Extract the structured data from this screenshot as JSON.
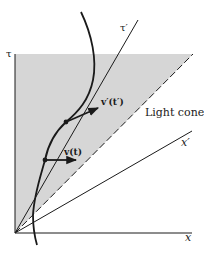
{
  "diagram": {
    "labels": {
      "tau_axis": "τ",
      "tau_prime_axis": "τ′",
      "x_axis": "x",
      "x_prime_axis": "x′",
      "light_cone": "Light cone",
      "velocity": "v(t)",
      "velocity_prime": "v′(t′)"
    },
    "colors": {
      "shade": "#d6d6d6",
      "line": "#1a1a1a"
    }
  }
}
